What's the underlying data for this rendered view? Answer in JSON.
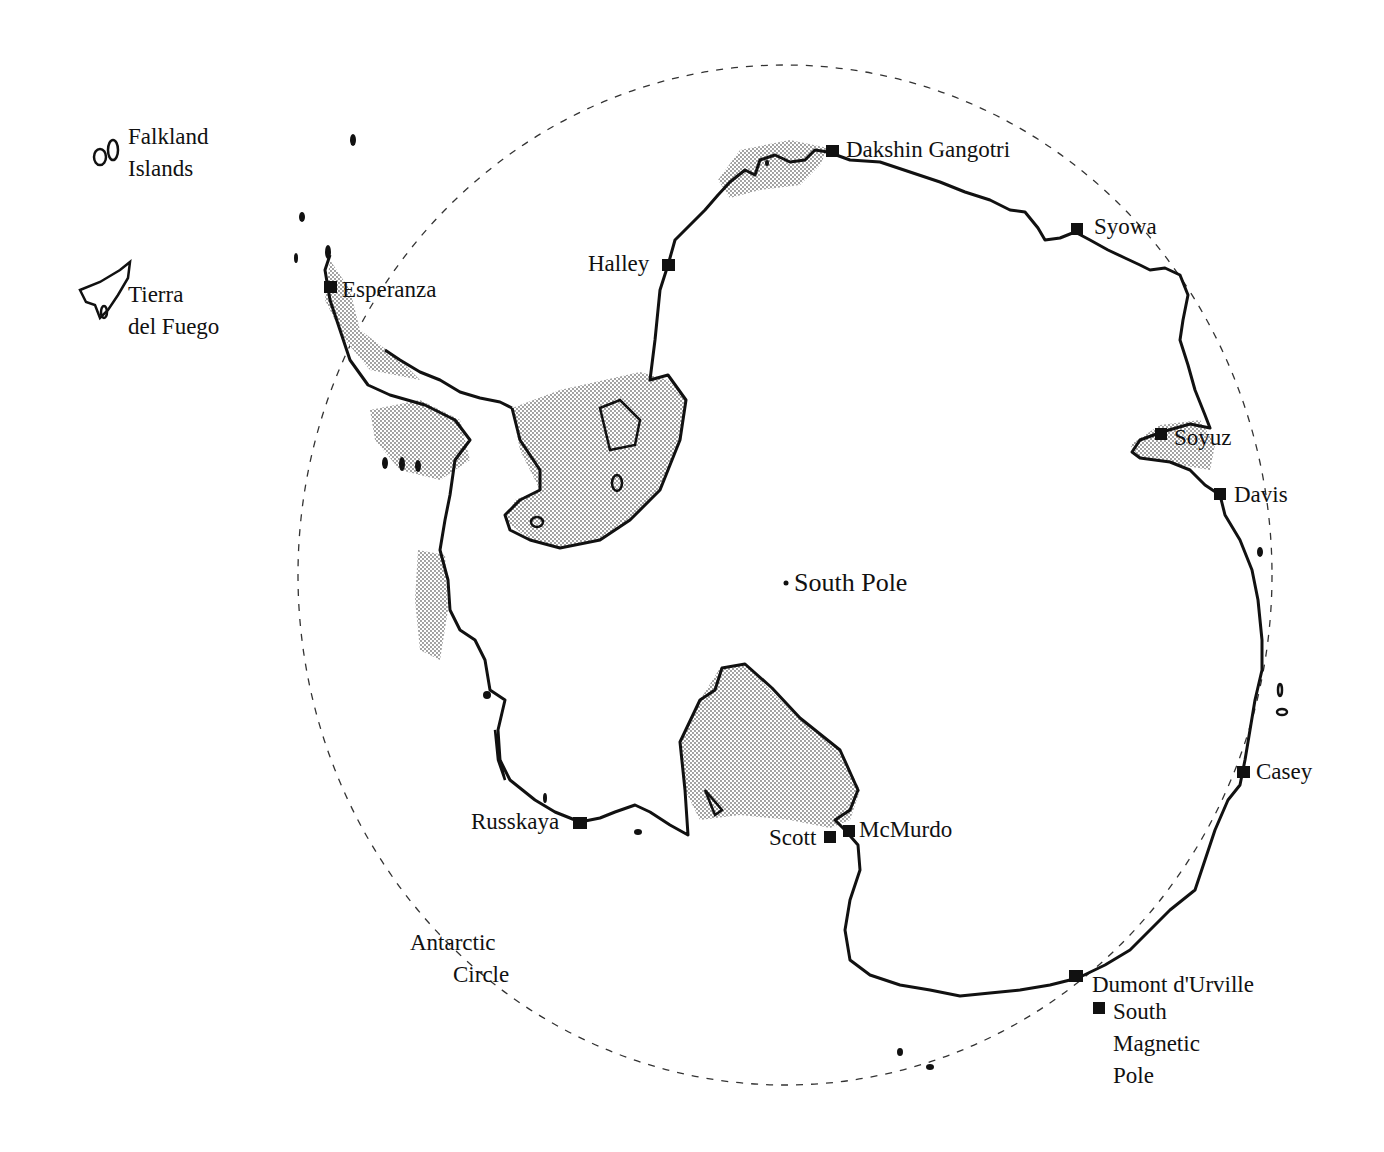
{
  "map": {
    "title": "Antarctica research stations",
    "colors": {
      "coast": "#111111",
      "shade": "#bdbdbd",
      "circle": "#333333",
      "background": "#ffffff"
    },
    "regions": [
      {
        "id": "falkland",
        "label_lines": [
          "Falkland",
          "Islands"
        ]
      },
      {
        "id": "tierra",
        "label_lines": [
          "Tierra",
          "del Fuego"
        ]
      },
      {
        "id": "antarctic-circle",
        "label_lines": [
          "Antarctic",
          "Circle"
        ]
      }
    ],
    "center": {
      "label": "South Pole"
    },
    "stations": [
      {
        "name": "Dakshin Gangotri"
      },
      {
        "name": "Syowa"
      },
      {
        "name": "Halley"
      },
      {
        "name": "Esperanza"
      },
      {
        "name": "Soyuz"
      },
      {
        "name": "Davis"
      },
      {
        "name": "Casey"
      },
      {
        "name": "Russkaya"
      },
      {
        "name": "McMurdo"
      },
      {
        "name": "Scott"
      },
      {
        "name": "Dumont d'Urville"
      }
    ],
    "magnetic_pole": {
      "label_lines": [
        "South",
        "Magnetic",
        "Pole"
      ]
    }
  }
}
